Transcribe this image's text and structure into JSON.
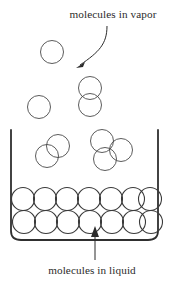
{
  "figure": {
    "type": "diagram",
    "width": 172,
    "height": 285,
    "background_color": "#ffffff",
    "line_color": "#2f2f2f",
    "molecule_stroke_color": "#4a4a4a",
    "text_color": "#2b2b2b"
  },
  "labels": {
    "vapor": {
      "text": "molecules in vapor",
      "x": 113,
      "y": 18,
      "font_size": 11.2
    },
    "liquid": {
      "text": "molecules in liquid",
      "x": 92,
      "y": 274,
      "font_size": 11.2
    }
  },
  "annotations": {
    "vapor_arrow": {
      "name": "vapor-callout-arrow",
      "path": "M 107 26 C 107 44 99 52 80 65",
      "head_points": "76,68 85,62 83,67",
      "points_to": "vapor molecule region"
    },
    "liquid_arrow": {
      "name": "liquid-callout-arrow",
      "path": "M 95 260 L 95 232",
      "head_points": "95,226 91,237 99,237",
      "points_to": "liquid molecule row"
    }
  },
  "vessel": {
    "name": "open-container",
    "path": "M 11 130 L 11 231 Q 11 240 21 240 L 148 240 Q 158 240 158 231 L 158 130",
    "left_wall_x": 11,
    "right_wall_x": 158,
    "rim_y": 130,
    "floor_y": 240,
    "corner_radius": 10
  },
  "vapor_molecules": [
    {
      "cx": 52,
      "cy": 52,
      "r": 11.5
    },
    {
      "cx": 90,
      "cy": 88,
      "r": 11.5
    },
    {
      "cx": 90,
      "cy": 105,
      "r": 11.5
    },
    {
      "cx": 39,
      "cy": 107,
      "r": 11.5
    },
    {
      "cx": 58,
      "cy": 146,
      "r": 11.5
    },
    {
      "cx": 47,
      "cy": 156,
      "r": 11.5
    },
    {
      "cx": 102,
      "cy": 141,
      "r": 11.5
    },
    {
      "cx": 121,
      "cy": 150,
      "r": 11.5
    },
    {
      "cx": 105,
      "cy": 159,
      "r": 11.5
    }
  ],
  "liquid_molecules": {
    "radius": 11.5,
    "rows": [
      {
        "name": "upper-liquid-row",
        "cy": 199,
        "cx_values": [
          23,
          45,
          67,
          89,
          111,
          133,
          150
        ]
      },
      {
        "name": "lower-liquid-row",
        "cy": 222,
        "cx_values": [
          24,
          46,
          68,
          90,
          112,
          134,
          151
        ]
      }
    ]
  },
  "counts": {
    "vapor_molecule_count": 9,
    "liquid_molecule_count": 14
  }
}
